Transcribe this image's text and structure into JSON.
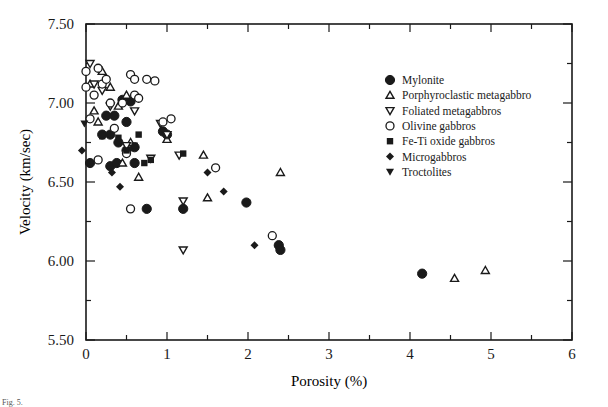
{
  "chart_data": {
    "type": "scatter",
    "title": "",
    "xlabel": "Porosity  (%)",
    "ylabel": "Velocity  (km/sec)",
    "xlim": [
      0,
      6
    ],
    "ylim": [
      5.5,
      7.5
    ],
    "x_ticks": [
      "0",
      "1",
      "2",
      "3",
      "4",
      "5",
      "6"
    ],
    "y_ticks": [
      "5.50",
      "6.00",
      "6.50",
      "7.00",
      "7.50"
    ],
    "grid": false,
    "legend_position": "upper right (inside)",
    "series": [
      {
        "name": "Mylonite",
        "marker": "filled-circle",
        "points": [
          [
            0.05,
            6.62
          ],
          [
            0.2,
            6.8
          ],
          [
            0.25,
            6.92
          ],
          [
            0.3,
            6.8
          ],
          [
            0.3,
            6.6
          ],
          [
            0.35,
            6.92
          ],
          [
            0.38,
            6.62
          ],
          [
            0.4,
            6.75
          ],
          [
            0.45,
            7.02
          ],
          [
            0.5,
            6.7
          ],
          [
            0.5,
            6.88
          ],
          [
            0.55,
            7.01
          ],
          [
            0.6,
            6.72
          ],
          [
            0.6,
            6.62
          ],
          [
            0.75,
            6.33
          ],
          [
            0.95,
            6.82
          ],
          [
            1.0,
            6.8
          ],
          [
            1.2,
            6.33
          ],
          [
            1.98,
            6.37
          ],
          [
            2.38,
            6.1
          ],
          [
            2.4,
            6.07
          ],
          [
            4.15,
            5.92
          ]
        ]
      },
      {
        "name": "Porphyroclastic metagabbro",
        "marker": "open-triangle-up",
        "points": [
          [
            0.05,
            7.12
          ],
          [
            0.1,
            6.95
          ],
          [
            0.15,
            6.88
          ],
          [
            0.2,
            7.2
          ],
          [
            0.3,
            7.1
          ],
          [
            0.4,
            6.98
          ],
          [
            0.45,
            6.62
          ],
          [
            0.5,
            7.05
          ],
          [
            0.55,
            6.75
          ],
          [
            0.65,
            6.53
          ],
          [
            1.0,
            6.77
          ],
          [
            1.45,
            6.67
          ],
          [
            1.5,
            6.4
          ],
          [
            2.4,
            6.56
          ],
          [
            4.55,
            5.89
          ],
          [
            4.93,
            5.94
          ]
        ]
      },
      {
        "name": "Foliated metagabbros",
        "marker": "open-triangle-down",
        "points": [
          [
            0.05,
            7.25
          ],
          [
            0.1,
            7.12
          ],
          [
            0.2,
            7.08
          ],
          [
            0.3,
            6.98
          ],
          [
            0.5,
            6.73
          ],
          [
            0.6,
            6.95
          ],
          [
            0.8,
            6.65
          ],
          [
            0.92,
            6.87
          ],
          [
            1.0,
            6.8
          ],
          [
            1.15,
            6.67
          ],
          [
            1.2,
            6.38
          ],
          [
            1.2,
            6.07
          ]
        ]
      },
      {
        "name": "Olivine gabbros",
        "marker": "open-circle",
        "points": [
          [
            0.0,
            7.2
          ],
          [
            0.0,
            7.1
          ],
          [
            0.05,
            6.9
          ],
          [
            0.1,
            7.05
          ],
          [
            0.15,
            7.22
          ],
          [
            0.15,
            6.64
          ],
          [
            0.2,
            7.12
          ],
          [
            0.25,
            7.15
          ],
          [
            0.3,
            7.0
          ],
          [
            0.35,
            6.84
          ],
          [
            0.45,
            7.0
          ],
          [
            0.5,
            6.68
          ],
          [
            0.55,
            7.18
          ],
          [
            0.6,
            7.15
          ],
          [
            0.6,
            7.05
          ],
          [
            0.55,
            6.33
          ],
          [
            0.65,
            7.03
          ],
          [
            0.75,
            7.15
          ],
          [
            0.85,
            7.14
          ],
          [
            0.95,
            6.88
          ],
          [
            1.05,
            6.9
          ],
          [
            1.6,
            6.59
          ],
          [
            2.3,
            6.16
          ]
        ]
      },
      {
        "name": "Fe-Ti oxide gabbros",
        "marker": "filled-square",
        "points": [
          [
            0.2,
            6.79
          ],
          [
            0.3,
            6.8
          ],
          [
            0.4,
            6.78
          ],
          [
            0.5,
            6.7
          ],
          [
            0.6,
            6.73
          ],
          [
            0.65,
            6.8
          ],
          [
            0.72,
            6.62
          ],
          [
            0.8,
            6.64
          ],
          [
            1.2,
            6.68
          ]
        ]
      },
      {
        "name": "Microgabbros",
        "marker": "filled-diamond",
        "points": [
          [
            -0.05,
            6.7
          ],
          [
            0.32,
            6.56
          ],
          [
            0.42,
            6.47
          ],
          [
            1.5,
            6.56
          ],
          [
            1.7,
            6.44
          ],
          [
            2.08,
            6.1
          ]
        ]
      },
      {
        "name": "Troctolites",
        "marker": "filled-triangle-down",
        "points": [
          [
            -0.02,
            6.87
          ]
        ]
      }
    ]
  },
  "legend": {
    "items": [
      {
        "label": "Mylonite",
        "marker": "filled-circle"
      },
      {
        "label": "Porphyroclastic metagabbro",
        "marker": "open-triangle-up"
      },
      {
        "label": "Foliated metagabbros",
        "marker": "open-triangle-down"
      },
      {
        "label": "Olivine gabbros",
        "marker": "open-circle"
      },
      {
        "label": "Fe-Ti oxide gabbros",
        "marker": "filled-square"
      },
      {
        "label": "Microgabbros",
        "marker": "filled-diamond"
      },
      {
        "label": "Troctolites",
        "marker": "filled-triangle-down"
      }
    ]
  },
  "caption": "Fig. 5."
}
